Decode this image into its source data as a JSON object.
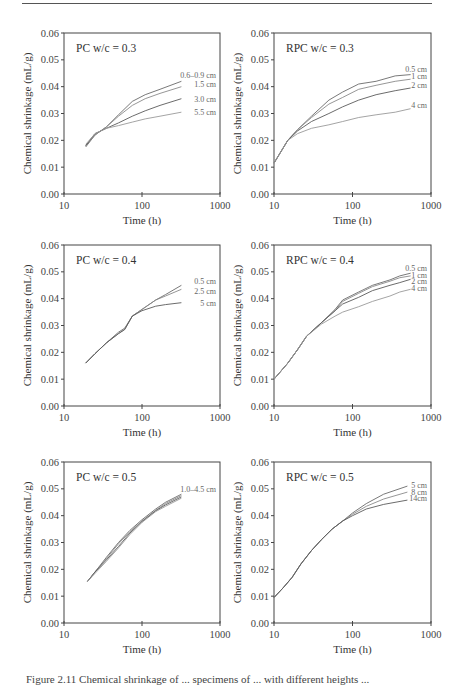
{
  "page": {
    "caption": "Figure 2.11  Chemical shrinkage of ... specimens of ... with different heights ..."
  },
  "chart_data": [
    {
      "type": "line",
      "title": "PC w/c = 0.3",
      "xlabel": "Time (h)",
      "ylabel": "Chemical shrinkage (mL/g)",
      "xscale": "log",
      "xlim": [
        10,
        1000
      ],
      "ylim": [
        0,
        0.06
      ],
      "xticks": [
        "10",
        "100",
        "1000"
      ],
      "yticks": [
        "0.00",
        "0.01",
        "0.02",
        "0.03",
        "0.04",
        "0.05",
        "0.06"
      ],
      "grid": false,
      "series": [
        {
          "name": "0.6–0.9 cm",
          "x": [
            19,
            25,
            35,
            50,
            75,
            110,
            170,
            320
          ],
          "y": [
            0.0175,
            0.022,
            0.025,
            0.0295,
            0.0345,
            0.037,
            0.039,
            0.042
          ]
        },
        {
          "name": "1.5 cm",
          "x": [
            19,
            25,
            35,
            50,
            75,
            110,
            170,
            320
          ],
          "y": [
            0.018,
            0.022,
            0.025,
            0.029,
            0.033,
            0.0355,
            0.0375,
            0.04
          ]
        },
        {
          "name": "3.0 cm",
          "x": [
            19,
            25,
            35,
            50,
            75,
            110,
            170,
            320
          ],
          "y": [
            0.018,
            0.0225,
            0.0245,
            0.0265,
            0.029,
            0.031,
            0.033,
            0.0355
          ]
        },
        {
          "name": "5.5 cm",
          "x": [
            19,
            25,
            35,
            50,
            75,
            110,
            170,
            320
          ],
          "y": [
            0.0185,
            0.0225,
            0.0245,
            0.0255,
            0.0268,
            0.028,
            0.029,
            0.0305
          ]
        }
      ],
      "label_positions": [
        {
          "text": "0.6–0.9 cm",
          "y": 0.0445
        },
        {
          "text": "1.5 cm",
          "y": 0.041
        },
        {
          "text": "3.0 cm",
          "y": 0.0355
        },
        {
          "text": "5.5 cm",
          "y": 0.0305
        }
      ]
    },
    {
      "type": "line",
      "title": "RPC w/c = 0.3",
      "xlabel": "Time (h)",
      "ylabel": "Chemical shrinkage (mL/g)",
      "xscale": "log",
      "xlim": [
        10,
        1000
      ],
      "ylim": [
        0,
        0.06
      ],
      "xticks": [
        "10",
        "100",
        "1000"
      ],
      "yticks": [
        "0.00",
        "0.01",
        "0.02",
        "0.03",
        "0.04",
        "0.05",
        "0.06"
      ],
      "grid": false,
      "series": [
        {
          "name": "0.5 cm",
          "x": [
            10,
            15,
            20,
            30,
            50,
            75,
            120,
            200,
            350,
            550
          ],
          "y": [
            0.0115,
            0.02,
            0.024,
            0.029,
            0.035,
            0.038,
            0.041,
            0.042,
            0.044,
            0.0445
          ]
        },
        {
          "name": "1 cm",
          "x": [
            10,
            15,
            20,
            30,
            50,
            75,
            120,
            200,
            350,
            550
          ],
          "y": [
            0.0115,
            0.02,
            0.024,
            0.0285,
            0.0335,
            0.036,
            0.039,
            0.0405,
            0.042,
            0.0428
          ]
        },
        {
          "name": "2 cm",
          "x": [
            10,
            15,
            20,
            30,
            50,
            75,
            120,
            200,
            350,
            550
          ],
          "y": [
            0.0115,
            0.02,
            0.0235,
            0.027,
            0.03,
            0.0325,
            0.035,
            0.037,
            0.0385,
            0.0395
          ]
        },
        {
          "name": "4 cm",
          "x": [
            10,
            15,
            20,
            30,
            50,
            75,
            120,
            200,
            350,
            550
          ],
          "y": [
            0.0115,
            0.02,
            0.0225,
            0.0245,
            0.0258,
            0.027,
            0.0285,
            0.0295,
            0.0305,
            0.0318
          ]
        }
      ],
      "label_positions": [
        {
          "text": "0.5 cm",
          "y": 0.0465
        },
        {
          "text": "1 cm",
          "y": 0.044
        },
        {
          "text": "2 cm",
          "y": 0.0405
        },
        {
          "text": "4 cm",
          "y": 0.033
        }
      ]
    },
    {
      "type": "line",
      "title": "PC w/c = 0.4",
      "xlabel": "Time (h)",
      "ylabel": "Chemical shrinkage (mL/g)",
      "xscale": "log",
      "xlim": [
        10,
        1000
      ],
      "ylim": [
        0,
        0.06
      ],
      "xticks": [
        "10",
        "100",
        "1000"
      ],
      "yticks": [
        "0.00",
        "0.01",
        "0.02",
        "0.03",
        "0.04",
        "0.05",
        "0.06"
      ],
      "grid": false,
      "series": [
        {
          "name": "0.5 cm",
          "x": [
            19,
            25,
            35,
            50,
            60,
            75,
            100,
            150,
            200,
            320
          ],
          "y": [
            0.016,
            0.0195,
            0.0235,
            0.0275,
            0.029,
            0.0335,
            0.036,
            0.0395,
            0.0415,
            0.045
          ]
        },
        {
          "name": "2.5 cm",
          "x": [
            19,
            25,
            35,
            50,
            60,
            75,
            100,
            150,
            200,
            320
          ],
          "y": [
            0.016,
            0.0195,
            0.0235,
            0.027,
            0.0285,
            0.0335,
            0.036,
            0.0395,
            0.041,
            0.0435
          ]
        },
        {
          "name": "5 cm",
          "x": [
            19,
            25,
            35,
            50,
            60,
            75,
            100,
            150,
            200,
            320
          ],
          "y": [
            0.016,
            0.0195,
            0.0235,
            0.027,
            0.0285,
            0.0335,
            0.0355,
            0.0372,
            0.0378,
            0.0385
          ]
        }
      ],
      "label_positions": [
        {
          "text": "0.5 cm",
          "y": 0.0465
        },
        {
          "text": "2.5 cm",
          "y": 0.043
        },
        {
          "text": "5 cm",
          "y": 0.0385
        }
      ]
    },
    {
      "type": "line",
      "title": "RPC w/c = 0.4",
      "xlabel": "Time (h)",
      "ylabel": "Chemical shrinkage (mL/g)",
      "xscale": "log",
      "xlim": [
        10,
        1000
      ],
      "ylim": [
        0,
        0.06
      ],
      "xticks": [
        "10",
        "100",
        "1000"
      ],
      "yticks": [
        "0.00",
        "0.01",
        "0.02",
        "0.03",
        "0.04",
        "0.05",
        "0.06"
      ],
      "grid": false,
      "series": [
        {
          "name": "0.5 cm",
          "x": [
            10,
            15,
            20,
            26,
            40,
            60,
            75,
            120,
            180,
            300,
            400,
            550
          ],
          "y": [
            0.01,
            0.016,
            0.021,
            0.026,
            0.031,
            0.036,
            0.0395,
            0.0425,
            0.045,
            0.047,
            0.0485,
            0.0495
          ]
        },
        {
          "name": "1 cm",
          "x": [
            10,
            15,
            20,
            26,
            40,
            60,
            75,
            120,
            180,
            300,
            400,
            550
          ],
          "y": [
            0.01,
            0.016,
            0.021,
            0.026,
            0.031,
            0.0355,
            0.039,
            0.042,
            0.0445,
            0.0465,
            0.0478,
            0.0485
          ]
        },
        {
          "name": "2 cm",
          "x": [
            10,
            15,
            20,
            26,
            40,
            60,
            75,
            120,
            180,
            300,
            400,
            550
          ],
          "y": [
            0.01,
            0.016,
            0.021,
            0.026,
            0.031,
            0.0355,
            0.038,
            0.0405,
            0.043,
            0.045,
            0.046,
            0.0472
          ]
        },
        {
          "name": "4 cm",
          "x": [
            10,
            15,
            20,
            26,
            40,
            60,
            75,
            120,
            180,
            300,
            400,
            550
          ],
          "y": [
            0.01,
            0.016,
            0.021,
            0.026,
            0.0305,
            0.0335,
            0.035,
            0.037,
            0.039,
            0.041,
            0.0425,
            0.0435
          ]
        }
      ],
      "label_positions": [
        {
          "text": "0.5 cm",
          "y": 0.0515
        },
        {
          "text": "1 cm",
          "y": 0.049
        },
        {
          "text": "2 cm",
          "y": 0.0465
        },
        {
          "text": "4 cm",
          "y": 0.044
        }
      ]
    },
    {
      "type": "line",
      "title": "PC w/c = 0.5",
      "xlabel": "Time (h)",
      "ylabel": "Chemical shrinkage (mL/g)",
      "xscale": "log",
      "xlim": [
        10,
        1000
      ],
      "ylim": [
        0,
        0.06
      ],
      "xticks": [
        "10",
        "100",
        "1000"
      ],
      "yticks": [
        "0.00",
        "0.01",
        "0.02",
        "0.03",
        "0.04",
        "0.05",
        "0.06"
      ],
      "grid": false,
      "series": [
        {
          "name": "1.0 cm",
          "x": [
            20,
            25,
            35,
            50,
            70,
            100,
            150,
            200,
            320
          ],
          "y": [
            0.0155,
            0.019,
            0.0245,
            0.03,
            0.0345,
            0.0385,
            0.0425,
            0.045,
            0.048
          ]
        },
        {
          "name": "2.0 cm",
          "x": [
            20,
            25,
            35,
            50,
            70,
            100,
            150,
            200,
            320
          ],
          "y": [
            0.0155,
            0.019,
            0.024,
            0.0295,
            0.034,
            0.038,
            0.042,
            0.0445,
            0.0475
          ]
        },
        {
          "name": "3.0 cm",
          "x": [
            20,
            25,
            35,
            50,
            70,
            100,
            150,
            200,
            320
          ],
          "y": [
            0.0155,
            0.019,
            0.0235,
            0.0285,
            0.0335,
            0.0378,
            0.0418,
            0.044,
            0.047
          ]
        },
        {
          "name": "4.5 cm",
          "x": [
            20,
            25,
            35,
            50,
            70,
            100,
            150,
            200,
            320
          ],
          "y": [
            0.0155,
            0.0185,
            0.023,
            0.028,
            0.033,
            0.0375,
            0.0415,
            0.0435,
            0.0465
          ]
        }
      ],
      "label_positions": [
        {
          "text": "1.0–4.5 cm",
          "y": 0.05
        }
      ]
    },
    {
      "type": "line",
      "title": "RPC w/c = 0.5",
      "xlabel": "Time (h)",
      "ylabel": "Chemical shrinkage (mL/g)",
      "xscale": "log",
      "xlim": [
        10,
        1000
      ],
      "ylim": [
        0,
        0.06
      ],
      "xticks": [
        "10",
        "100",
        "1000"
      ],
      "yticks": [
        "0.00",
        "0.01",
        "0.02",
        "0.03",
        "0.04",
        "0.05",
        "0.06"
      ],
      "grid": false,
      "series": [
        {
          "name": "5 cm",
          "x": [
            10,
            13,
            17,
            22,
            30,
            40,
            55,
            75,
            100,
            150,
            250,
            500
          ],
          "y": [
            0.0095,
            0.013,
            0.017,
            0.022,
            0.027,
            0.031,
            0.035,
            0.038,
            0.041,
            0.0445,
            0.048,
            0.051
          ]
        },
        {
          "name": "8 cm",
          "x": [
            10,
            13,
            17,
            22,
            30,
            40,
            55,
            75,
            100,
            150,
            250,
            500
          ],
          "y": [
            0.0095,
            0.013,
            0.017,
            0.022,
            0.027,
            0.031,
            0.035,
            0.038,
            0.0405,
            0.0435,
            0.0462,
            0.0488
          ]
        },
        {
          "name": "14 cm",
          "x": [
            10,
            13,
            17,
            22,
            30,
            40,
            55,
            75,
            100,
            150,
            250,
            500
          ],
          "y": [
            0.0095,
            0.013,
            0.017,
            0.022,
            0.027,
            0.031,
            0.035,
            0.038,
            0.04,
            0.0425,
            0.0442,
            0.0458
          ]
        }
      ],
      "label_positions": [
        {
          "text": "5 cm",
          "y": 0.0515
        },
        {
          "text": "8 cm",
          "y": 0.049
        },
        {
          "text": "14cm",
          "y": 0.0465
        }
      ]
    }
  ]
}
